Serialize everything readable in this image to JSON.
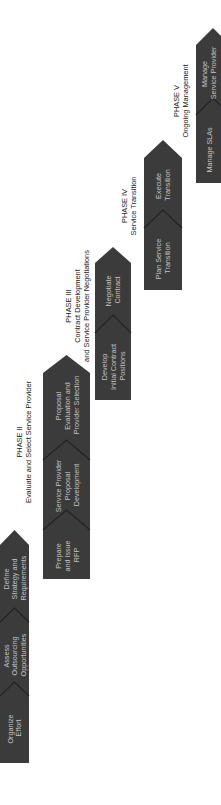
{
  "diagram": {
    "colors": {
      "strip": "#3b3b3b",
      "step_text": "#c4c4c4",
      "phase_text": "#1a1a1a",
      "background": "#ffffff"
    },
    "phases": [
      {
        "id": "phase-1",
        "title": "",
        "subtitle_lines": [],
        "steps": [
          {
            "lines": [
              "Organize",
              "Effort"
            ]
          },
          {
            "lines": [
              "Assess",
              "Outsourcing",
              "Opportunities"
            ]
          },
          {
            "lines": [
              "Define",
              "Strategy and",
              "Requirements"
            ]
          }
        ]
      },
      {
        "id": "phase-2",
        "title": "PHASE II",
        "subtitle_lines": [
          "Evaluate and Select Service Provider"
        ],
        "steps": [
          {
            "lines": [
              "Prepare",
              "and Issue",
              "RFP"
            ]
          },
          {
            "lines": [
              "Service Provider",
              "Proposal",
              "Development"
            ]
          },
          {
            "lines": [
              "Proposal",
              "Evaluation and",
              "Provider Selection"
            ]
          }
        ]
      },
      {
        "id": "phase-3",
        "title": "PHASE III",
        "subtitle_lines": [
          "Contract Development",
          "and Service Provider Negotiations"
        ],
        "steps": [
          {
            "lines": [
              "Develop",
              "Initial Contract",
              "Positions"
            ]
          },
          {
            "lines": [
              "Negotiate",
              "Contract"
            ]
          }
        ]
      },
      {
        "id": "phase-4",
        "title": "PHASE IV",
        "subtitle_lines": [
          "Service Transition"
        ],
        "steps": [
          {
            "lines": [
              "Plan Service",
              "Transition"
            ]
          },
          {
            "lines": [
              "Execute",
              "Transition"
            ]
          }
        ]
      },
      {
        "id": "phase-5",
        "title": "PHASE V",
        "subtitle_lines": [
          "Ongoing Management"
        ],
        "steps": [
          {
            "lines": [
              "Manage SLAs"
            ]
          },
          {
            "lines": [
              "Manage",
              "Service Provider"
            ]
          }
        ]
      }
    ]
  }
}
